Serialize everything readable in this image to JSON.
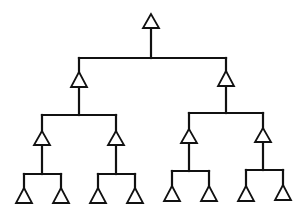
{
  "diagram": {
    "type": "binary-tree",
    "colors": {
      "stroke": "#111111",
      "background": "#ffffff",
      "node_fill": "#ffffff"
    },
    "node_shape": "triangle",
    "levels": [
      {
        "depth": 0,
        "nodes": [
          {
            "id": "root",
            "x": 151,
            "apex_y": 14,
            "base_y": 28
          }
        ]
      },
      {
        "depth": 1,
        "nodes": [
          {
            "id": "L",
            "x": 79,
            "apex_y": 72,
            "base_y": 87,
            "parent": "root"
          },
          {
            "id": "R",
            "x": 226,
            "apex_y": 71,
            "base_y": 86,
            "parent": "root"
          }
        ]
      },
      {
        "depth": 2,
        "nodes": [
          {
            "id": "LL",
            "x": 42,
            "apex_y": 131,
            "base_y": 145,
            "parent": "L"
          },
          {
            "id": "LR",
            "x": 116,
            "apex_y": 131,
            "base_y": 145,
            "parent": "L"
          },
          {
            "id": "RL",
            "x": 189,
            "apex_y": 129,
            "base_y": 143,
            "parent": "R"
          },
          {
            "id": "RR",
            "x": 263,
            "apex_y": 128,
            "base_y": 142,
            "parent": "R"
          }
        ]
      },
      {
        "depth": 3,
        "nodes": [
          {
            "id": "LLL",
            "x": 24,
            "apex_y": 188,
            "base_y": 203,
            "parent": "LL"
          },
          {
            "id": "LLR",
            "x": 61,
            "apex_y": 188,
            "base_y": 203,
            "parent": "LL"
          },
          {
            "id": "LRL",
            "x": 98,
            "apex_y": 188,
            "base_y": 203,
            "parent": "LR"
          },
          {
            "id": "LRR",
            "x": 135,
            "apex_y": 188,
            "base_y": 203,
            "parent": "LR"
          },
          {
            "id": "RLL",
            "x": 172,
            "apex_y": 186,
            "base_y": 201,
            "parent": "RL"
          },
          {
            "id": "RLR",
            "x": 209,
            "apex_y": 186,
            "base_y": 201,
            "parent": "RL"
          },
          {
            "id": "RRL",
            "x": 246,
            "apex_y": 186,
            "base_y": 201,
            "parent": "RR"
          },
          {
            "id": "RRR",
            "x": 283,
            "apex_y": 185,
            "base_y": 200,
            "parent": "RR"
          }
        ]
      }
    ],
    "bars": [
      {
        "id": "bar-root",
        "y": 58,
        "x1": 79,
        "x2": 226,
        "stem_top": 28,
        "stem_x": 151
      },
      {
        "id": "bar-L",
        "y": 115,
        "x1": 42,
        "x2": 116,
        "stem_top": 87,
        "stem_x": 79
      },
      {
        "id": "bar-R",
        "y": 113,
        "x1": 189,
        "x2": 263,
        "stem_top": 86,
        "stem_x": 226
      },
      {
        "id": "bar-LL",
        "y": 174,
        "x1": 24,
        "x2": 61,
        "stem_top": 145,
        "stem_x": 42
      },
      {
        "id": "bar-LR",
        "y": 174,
        "x1": 98,
        "x2": 135,
        "stem_top": 145,
        "stem_x": 116
      },
      {
        "id": "bar-RL",
        "y": 171,
        "x1": 172,
        "x2": 209,
        "stem_top": 143,
        "stem_x": 189
      },
      {
        "id": "bar-RR",
        "y": 170,
        "x1": 246,
        "x2": 283,
        "stem_top": 142,
        "stem_x": 263
      }
    ],
    "triangle_half_width": 8
  }
}
